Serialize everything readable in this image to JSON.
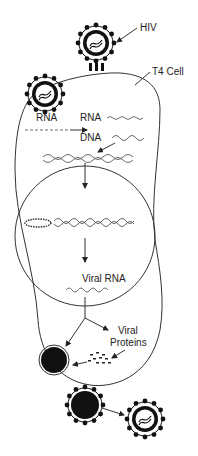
{
  "diagram": {
    "labels": {
      "hiv": "HIV",
      "t4_cell": "T4 Cell",
      "rna_viral": "RNA",
      "rna": "RNA",
      "dna": "DNA",
      "viral_rna": "Viral RNA",
      "viral_proteins_line1": "Viral",
      "viral_proteins_line2": "Proteins"
    },
    "colors": {
      "ink": "#222222",
      "background": "#ffffff"
    },
    "stages": [
      "HIV attaches to T4 cell",
      "HIV enters cell, releases RNA",
      "RNA reverse-transcribed to DNA",
      "DNA integrates into host genome in nucleus",
      "Viral RNA transcribed",
      "Viral proteins produced",
      "New virus assembled and buds from cell"
    ]
  }
}
